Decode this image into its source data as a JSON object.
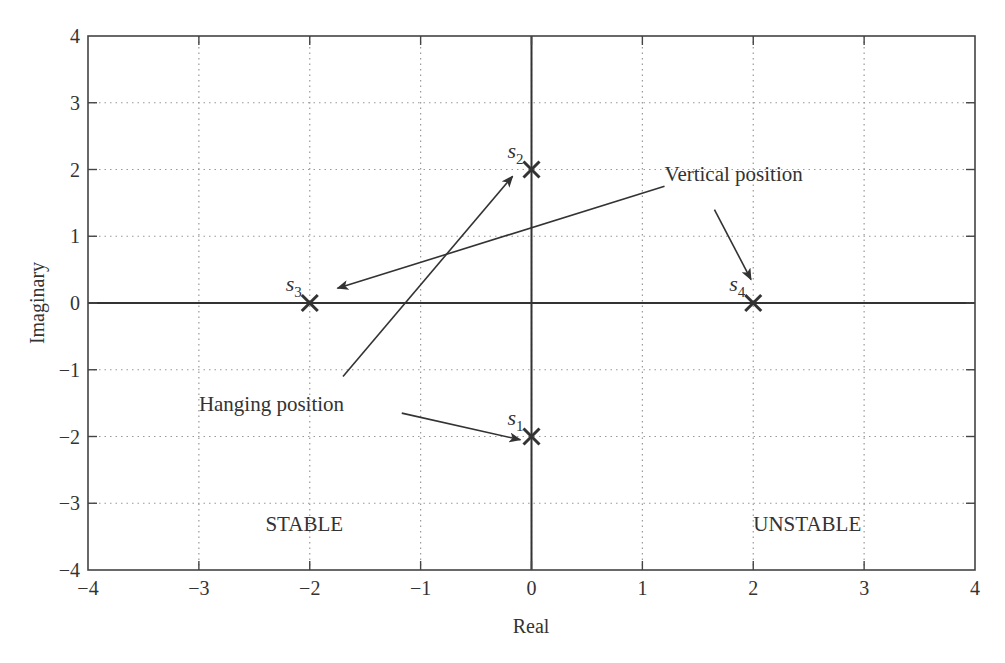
{
  "chart_data": {
    "type": "scatter",
    "title": "",
    "xlabel": "Real",
    "ylabel": "Imaginary",
    "xlim": [
      -4,
      4
    ],
    "ylim": [
      -4,
      4
    ],
    "grid": true,
    "x_ticks": [
      "−4",
      "−3",
      "−2",
      "−1",
      "0",
      "1",
      "2",
      "3",
      "4"
    ],
    "y_ticks": [
      "−4",
      "−3",
      "−2",
      "−1",
      "0",
      "1",
      "2",
      "3",
      "4"
    ],
    "points": [
      {
        "label": "s1",
        "sub": "1",
        "x": 0,
        "y": -2,
        "marker": "x"
      },
      {
        "label": "s2",
        "sub": "2",
        "x": 0,
        "y": 2,
        "marker": "x"
      },
      {
        "label": "s3",
        "sub": "3",
        "x": -2,
        "y": 0,
        "marker": "x"
      },
      {
        "label": "s4",
        "sub": "4",
        "x": 2,
        "y": 0,
        "marker": "x"
      }
    ],
    "annotations": [
      {
        "text": "Vertical position",
        "x": 1.2,
        "y": 1.95
      },
      {
        "text": "Hanging position",
        "x": -3.0,
        "y": -1.5
      },
      {
        "text": "STABLE",
        "x": -2.4,
        "y": -3.3
      },
      {
        "text": "UNSTABLE",
        "x": 2.0,
        "y": -3.3
      }
    ],
    "arrows": [
      {
        "from_label": "Vertical position",
        "to": "s3",
        "from": [
          1.2,
          1.75
        ],
        "end": [
          -1.75,
          0.22
        ]
      },
      {
        "from_label": "Vertical position",
        "to": "s4",
        "from": [
          1.65,
          1.4
        ],
        "end": [
          1.98,
          0.35
        ]
      },
      {
        "from_label": "Hanging position",
        "to": "s2",
        "from": [
          -1.7,
          -1.1
        ],
        "end": [
          -0.17,
          1.9
        ]
      },
      {
        "from_label": "Hanging position",
        "to": "s1",
        "from": [
          -1.17,
          -1.65
        ],
        "end": [
          -0.1,
          -2.05
        ]
      }
    ]
  }
}
